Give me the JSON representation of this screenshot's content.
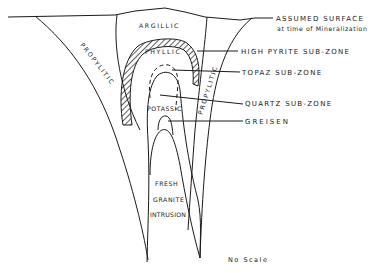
{
  "diagram": {
    "zones": {
      "argillic": "ARGILLIC",
      "phyllic": "PHYLLIC",
      "propylitic_left": "PROPYLITIC",
      "propylitic_right": "PROPYLITIC",
      "potassic": "POTASSIC",
      "fresh_line1": "FRESH",
      "fresh_line2": "GRANITE",
      "fresh_line3": "INTRUSION"
    },
    "callouts": {
      "surface_line1": "ASSUMED SURFACE",
      "surface_line2": "at time of Mineralization",
      "high_pyrite": "HIGH PYRITE SUB-ZONE",
      "topaz": "TOPAZ SUB-ZONE",
      "quartz": "QUARTZ SUB-ZONE",
      "greisen": "GREISEN"
    },
    "scale_note": "No Scale",
    "colors": {
      "line": "#1a1a1a",
      "background": "#ffffff"
    }
  }
}
